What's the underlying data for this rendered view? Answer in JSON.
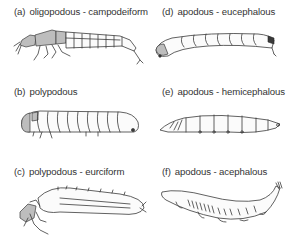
{
  "figure": {
    "panels": [
      {
        "id": "a",
        "tag": "(a)",
        "label": "oligopodous - campodeiform"
      },
      {
        "id": "b",
        "tag": "(b)",
        "label": "polypodous"
      },
      {
        "id": "c",
        "tag": "(c)",
        "label": "polypodous - eurciform"
      },
      {
        "id": "d",
        "tag": "(d)",
        "label": "apodous - eucephalous"
      },
      {
        "id": "e",
        "tag": "(e)",
        "label": "apodous - hemicephalous"
      },
      {
        "id": "f",
        "tag": "(f)",
        "label": "apodous - acephalous"
      }
    ],
    "colors": {
      "line": "#3a3a3a",
      "shade": "#bdbdbd",
      "background": "#ffffff"
    }
  }
}
